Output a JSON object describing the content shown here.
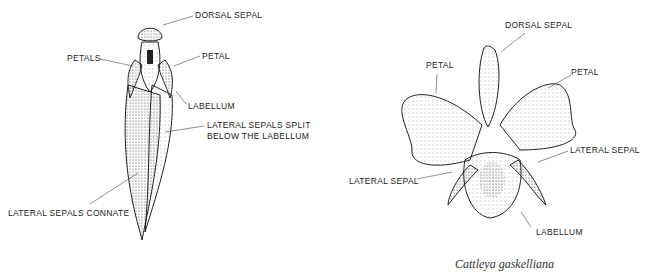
{
  "left_diagram": {
    "labels": {
      "dorsal_sepal": "DORSAL SEPAL",
      "petals": "PETALS",
      "petal": "PETAL",
      "labellum": "LABELLUM",
      "lateral_split_1": "LATERAL SEPALS SPLIT",
      "lateral_split_2": "BELOW THE LABELLUM",
      "connate": "LATERAL SEPALS CONNATE"
    }
  },
  "right_diagram": {
    "labels": {
      "dorsal_sepal": "DORSAL SEPAL",
      "petal_left": "PETAL",
      "petal_right": "PETAL",
      "lateral_sepal_right": "LATERAL SEPAL",
      "lateral_sepal_left": "LATERAL SEPAL",
      "labellum": "LABELLUM"
    },
    "caption": "Cattleya gaskelliana"
  }
}
